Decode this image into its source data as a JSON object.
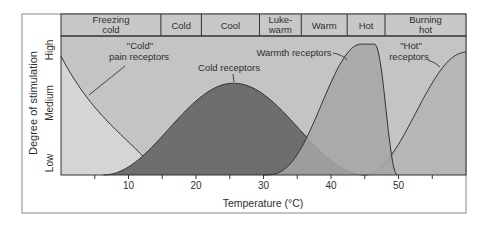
{
  "diagram": {
    "title": "",
    "y_axis_label": "Degree of stimulation",
    "y_levels": [
      "Low",
      "Medium",
      "High"
    ],
    "x_axis_label": "Temperature (°C)",
    "x_ticks": [
      10,
      20,
      30,
      40,
      50
    ],
    "x_minor_ticks": [
      5,
      15,
      25,
      35,
      45,
      55
    ],
    "x_range": [
      0,
      60
    ],
    "sensation_bands": [
      {
        "label_lines": [
          "Freezing",
          "cold"
        ],
        "from": 0,
        "to": 14.8
      },
      {
        "label_lines": [
          "Cold"
        ],
        "from": 14.8,
        "to": 20.8
      },
      {
        "label_lines": [
          "Cool"
        ],
        "from": 20.8,
        "to": 29.4
      },
      {
        "label_lines": [
          "Luke-",
          "warm"
        ],
        "from": 29.4,
        "to": 35.6
      },
      {
        "label_lines": [
          "Warm"
        ],
        "from": 35.6,
        "to": 42.4
      },
      {
        "label_lines": [
          "Hot"
        ],
        "from": 42.4,
        "to": 48
      },
      {
        "label_lines": [
          "Burning",
          "hot"
        ],
        "from": 48,
        "to": 60
      }
    ],
    "curves": [
      {
        "name": "cold-pain-receptors",
        "label_lines": [
          "\"Cold\"",
          "pain receptors"
        ],
        "start": 0,
        "end": 14.7,
        "peak_at": 0,
        "peak_level": 0.88,
        "fill": "#d8d8d8"
      },
      {
        "name": "cold-receptors",
        "label_lines": [
          "Cold receptors"
        ],
        "start": 6.3,
        "end": 45,
        "peak_at": 25.6,
        "peak_level": 0.68,
        "fill": "#6e6e6e"
      },
      {
        "name": "warmth-receptors",
        "label_lines": [
          "Warmth receptors"
        ],
        "start": 30,
        "end": 49.8,
        "peak_at": 45.5,
        "peak_level": 0.97,
        "fill": "#a6a6a6"
      },
      {
        "name": "hot-receptors",
        "label_lines": [
          "\"Hot\"",
          "receptors"
        ],
        "start": 45,
        "end": 60,
        "peak_at": 60,
        "peak_level": 0.91,
        "fill": "#b4b4b4"
      }
    ],
    "colors": {
      "background_fill": "#c4c4c4",
      "band_fill": "#c8c8c8",
      "line": "#333333"
    }
  }
}
